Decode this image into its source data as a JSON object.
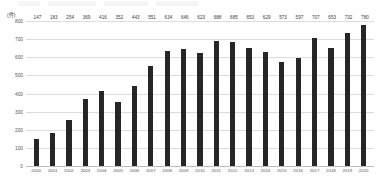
{
  "chart_data": {
    "type": "bar",
    "title": "",
    "subtitle": "",
    "xlabel": "",
    "ylabel": "(件)",
    "unit_label": "(件)",
    "ylim": [
      0,
      800
    ],
    "yticks": [
      800,
      700,
      600,
      500,
      400,
      300,
      200,
      100,
      0
    ],
    "grid": true,
    "legend": false,
    "bar_color": "#262626",
    "grid_color": "#dcdcdc",
    "axis_color": "#bdbdbd",
    "categories": [
      "2000",
      "2001",
      "2002",
      "2003",
      "2004",
      "2005",
      "2006",
      "2007",
      "2008",
      "2009",
      "2010",
      "2011",
      "2012",
      "2013",
      "2014",
      "2015",
      "2016",
      "2017",
      "2018",
      "2019",
      "2020"
    ],
    "values": [
      147,
      183,
      254,
      369,
      416,
      352,
      443,
      551,
      634,
      646,
      623,
      688,
      685,
      653,
      629,
      573,
      597,
      707,
      653,
      732,
      780
    ],
    "data_labels": [
      "147",
      "183",
      "254",
      "369",
      "416",
      "352",
      "443",
      "551",
      "634",
      "646",
      "623",
      "688",
      "685",
      "653",
      "629",
      "573",
      "597",
      "707",
      "653",
      "732",
      "780"
    ]
  }
}
